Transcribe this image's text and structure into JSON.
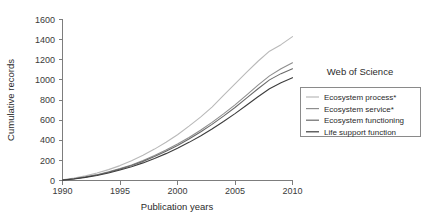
{
  "chart_data": {
    "type": "line",
    "title": "",
    "xlabel": "Publication years",
    "ylabel": "Cumulative records",
    "xlim": [
      1990,
      2010
    ],
    "ylim": [
      0,
      1600
    ],
    "xticks": [
      1990,
      1995,
      2000,
      2005,
      2010
    ],
    "yticks": [
      0,
      200,
      400,
      600,
      800,
      1000,
      1200,
      1400,
      1600
    ],
    "grid": false,
    "legend_position": "right",
    "legend_title": "Web of Science",
    "x": [
      1990,
      1991,
      1992,
      1993,
      1994,
      1995,
      1996,
      1997,
      1998,
      1999,
      2000,
      2001,
      2002,
      2003,
      2004,
      2005,
      2006,
      2007,
      2008,
      2009,
      2010
    ],
    "series": [
      {
        "name": "Ecosystem process*",
        "color": "#b9b9b9",
        "values": [
          8,
          24,
          46,
          74,
          108,
          148,
          196,
          250,
          312,
          380,
          455,
          540,
          630,
          730,
          845,
          960,
          1075,
          1185,
          1285,
          1350,
          1430
        ]
      },
      {
        "name": "Ecosystem service*",
        "color": "#8e8e8e",
        "values": [
          5,
          18,
          36,
          58,
          86,
          118,
          155,
          198,
          248,
          302,
          362,
          428,
          500,
          578,
          662,
          752,
          848,
          948,
          1040,
          1110,
          1170
        ]
      },
      {
        "name": "Ecosystem functioning",
        "color": "#6a6a6a",
        "values": [
          5,
          17,
          34,
          55,
          82,
          113,
          149,
          190,
          238,
          290,
          348,
          412,
          482,
          558,
          640,
          726,
          818,
          912,
          1000,
          1062,
          1110
        ]
      },
      {
        "name": "Life support function",
        "color": "#3d3d3d",
        "values": [
          4,
          15,
          31,
          50,
          75,
          104,
          137,
          175,
          219,
          267,
          320,
          379,
          443,
          512,
          586,
          665,
          748,
          832,
          912,
          972,
          1022
        ]
      }
    ]
  },
  "legend": {
    "title": "Web of Science",
    "entries": [
      {
        "label": "Ecosystem process*"
      },
      {
        "label": "Ecosystem service*"
      },
      {
        "label": "Ecosystem functioning"
      },
      {
        "label": "Life support function"
      }
    ]
  },
  "axes": {
    "x_title": "Publication years",
    "y_title": "Cumulative records",
    "x_tick_labels": [
      "1990",
      "1995",
      "2000",
      "2005",
      "2010"
    ],
    "y_tick_labels": [
      "0",
      "200",
      "400",
      "600",
      "800",
      "1000",
      "1200",
      "1400",
      "1600"
    ]
  }
}
